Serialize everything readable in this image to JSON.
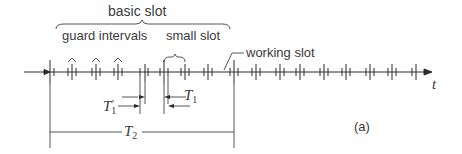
{
  "diagram": {
    "labels": {
      "basic_slot": "basic slot",
      "guard_intervals": "guard intervals",
      "small_slot": "small slot",
      "working_slot": "working slot",
      "time_axis": "t",
      "t1_prime": "T",
      "t1_prime_sub": "1",
      "t1_prime_mark": "'",
      "t1": "T",
      "t1_sub": "1",
      "t2": "T",
      "t2_sub": "2",
      "panel": "(a)"
    },
    "colors": {
      "line": "#2b2b2b",
      "text": "#3a3a3a",
      "background": "#ffffff"
    }
  }
}
